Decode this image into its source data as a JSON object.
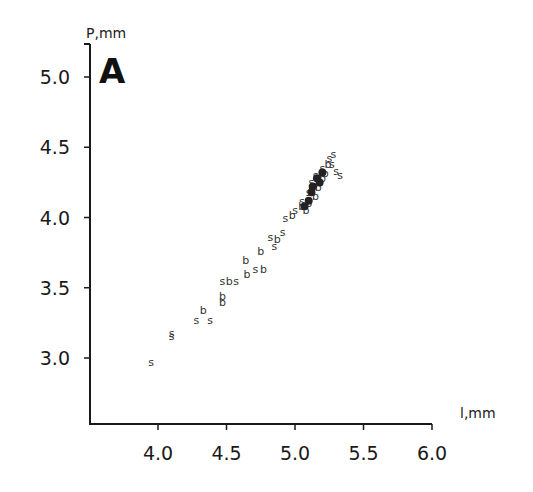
{
  "chart_data": {
    "type": "scatter",
    "title": "",
    "panel_label": "A",
    "xlabel": "l,mm",
    "ylabel": "P,mm",
    "xlim": [
      3.6,
      6.0
    ],
    "ylim": [
      2.5,
      5.2
    ],
    "x_ticks": [
      "4.0",
      "4.5",
      "5.0",
      "5.5",
      "6.0"
    ],
    "y_ticks": [
      "3.0",
      "3.5",
      "4.0",
      "4.5",
      "5.0"
    ],
    "grid": false,
    "legend": "none (point markers are letters 's' and 'b')",
    "series": [
      {
        "name": "s",
        "marker": "s",
        "points": [
          [
            3.95,
            2.97
          ],
          [
            4.1,
            3.18
          ],
          [
            4.1,
            3.16
          ],
          [
            4.28,
            3.27
          ],
          [
            4.38,
            3.27
          ],
          [
            4.47,
            3.55
          ],
          [
            4.57,
            3.55
          ],
          [
            4.71,
            3.63
          ],
          [
            4.85,
            3.8
          ],
          [
            4.82,
            3.86
          ],
          [
            4.91,
            3.9
          ],
          [
            4.93,
            4.0
          ],
          [
            5.0,
            4.05
          ],
          [
            5.05,
            4.12
          ],
          [
            5.1,
            4.18
          ],
          [
            5.12,
            4.25
          ],
          [
            5.15,
            4.3
          ],
          [
            5.2,
            4.35
          ],
          [
            5.25,
            4.42
          ],
          [
            5.27,
            4.38
          ],
          [
            5.3,
            4.33
          ],
          [
            5.33,
            4.3
          ],
          [
            5.28,
            4.45
          ]
        ]
      },
      {
        "name": "b",
        "marker": "b",
        "points": [
          [
            4.33,
            3.34
          ],
          [
            4.47,
            3.4
          ],
          [
            4.47,
            3.44
          ],
          [
            4.52,
            3.55
          ],
          [
            4.65,
            3.6
          ],
          [
            4.64,
            3.7
          ],
          [
            4.77,
            3.63
          ],
          [
            4.75,
            3.76
          ],
          [
            4.87,
            3.85
          ],
          [
            4.98,
            4.02
          ],
          [
            5.05,
            4.08
          ],
          [
            5.1,
            4.1
          ],
          [
            5.12,
            4.2
          ],
          [
            5.17,
            4.22
          ],
          [
            5.2,
            4.28
          ],
          [
            5.22,
            4.32
          ],
          [
            5.24,
            4.38
          ],
          [
            5.15,
            4.15
          ],
          [
            5.08,
            4.05
          ]
        ]
      }
    ]
  },
  "labels": {
    "panel": "A",
    "x_axis_title": "l,mm",
    "y_axis_title": "P,mm"
  }
}
